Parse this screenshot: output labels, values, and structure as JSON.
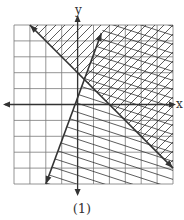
{
  "figure": {
    "caption": "(1)",
    "x_axis_label": "x",
    "y_axis_label": "y",
    "grid": {
      "x_range": [
        -4,
        6
      ],
      "y_range": [
        -5,
        5
      ],
      "step": 1
    },
    "lines": [
      {
        "name": "line-negative-slope",
        "from": [
          -3,
          5
        ],
        "to": [
          6,
          -4
        ],
        "shading": "above-right, hatched"
      },
      {
        "name": "line-positive-slope",
        "from": [
          -2,
          -5
        ],
        "to": [
          1.5,
          4.5
        ],
        "shading": "right, hatched"
      }
    ],
    "colors": {
      "ink": "#333333",
      "grid": "#7a7a7a",
      "background": "#ffffff"
    }
  }
}
